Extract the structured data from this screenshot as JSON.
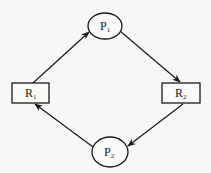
{
  "diagram": {
    "type": "resource-allocation-graph",
    "nodes": [
      {
        "id": "P1",
        "kind": "process",
        "shape": "ellipse",
        "label": "P",
        "subscript": "1",
        "cx": 105,
        "cy": 26,
        "rx": 17,
        "ry": 13
      },
      {
        "id": "R1",
        "kind": "resource",
        "shape": "rect",
        "label": "R",
        "subscript": "1",
        "x": 12,
        "y": 83,
        "w": 37,
        "h": 20
      },
      {
        "id": "R2",
        "kind": "resource",
        "shape": "rect",
        "label": "R",
        "subscript": "2",
        "x": 162,
        "y": 83,
        "w": 38,
        "h": 20
      },
      {
        "id": "P2",
        "kind": "process",
        "shape": "ellipse",
        "label": "P",
        "subscript": "2",
        "cx": 110,
        "cy": 152,
        "rx": 18,
        "ry": 15
      }
    ],
    "edges": [
      {
        "from": "R1",
        "to": "P1"
      },
      {
        "from": "P1",
        "to": "R2"
      },
      {
        "from": "R2",
        "to": "P2"
      },
      {
        "from": "P2",
        "to": "R1"
      }
    ],
    "colors": {
      "stroke": "#1a1a1a",
      "background": "#f7f7f5"
    }
  }
}
